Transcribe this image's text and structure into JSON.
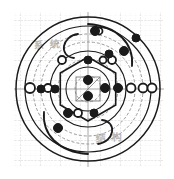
{
  "figure": {
    "kind": "technical-drawing",
    "background": "#ffffff",
    "ink": "#1a1a1a",
    "grid_minor_color": "#d9d9d9",
    "grid_major_color": "#bdbdbd",
    "axis_color": "#8a8a8a",
    "watermark_color": "#b8b8b8",
    "width": 174,
    "height": 179
  },
  "watermarks": [
    {
      "id": "top-left",
      "text": "系 统",
      "x": 34,
      "y": 36
    },
    {
      "id": "bottom-right",
      "text": "结 构",
      "x": 96,
      "y": 129
    }
  ],
  "grid": {
    "minor_spacing": 5,
    "major_spacing": 20,
    "origin_x": 88,
    "origin_y": 89,
    "style": "dotted"
  },
  "chart_data": {
    "type": "scatter",
    "title": "",
    "xlabel": "",
    "ylabel": "",
    "center": [
      88,
      89
    ],
    "rings": [
      {
        "name": "outer-boundary",
        "r": 72,
        "stroke": "#1a1a1a",
        "width": 1.5,
        "dash": "none"
      },
      {
        "name": "ring-2",
        "r": 63,
        "stroke": "#1a1a1a",
        "width": 1.2,
        "dash": "none"
      },
      {
        "name": "ring-3",
        "r": 55,
        "stroke": "#9a9a9a",
        "width": 1.0,
        "dash": "3 2"
      },
      {
        "name": "ring-4",
        "r": 47,
        "stroke": "#9a9a9a",
        "width": 1.0,
        "dash": "3 2"
      },
      {
        "name": "ring-5",
        "r": 38,
        "stroke": "#1a1a1a",
        "width": 1.2,
        "dash": "none"
      },
      {
        "name": "ring-6",
        "r": 30,
        "stroke": "#9a9a9a",
        "width": 1.0,
        "dash": "3 2"
      },
      {
        "name": "ring-7",
        "r": 22,
        "stroke": "#1a1a1a",
        "width": 1.1,
        "dash": "none"
      },
      {
        "name": "ring-8",
        "r": 13,
        "stroke": "#9a9a9a",
        "width": 1.0,
        "dash": "3 2"
      }
    ],
    "hexagon": {
      "name": "inner-hexagon",
      "r": 32,
      "rotation": 0,
      "stroke": "#1a1a1a",
      "width": 1.6
    },
    "center_square": {
      "x": 76,
      "y": 77,
      "w": 24,
      "h": 24,
      "stroke": "#7a7a7a"
    },
    "nodes_filled": [
      {
        "id": "n01",
        "x": 88,
        "y": 60,
        "r": 4
      },
      {
        "id": "n02",
        "x": 109,
        "y": 54,
        "r": 4
      },
      {
        "id": "n03",
        "x": 124,
        "y": 51,
        "r": 4.5
      },
      {
        "id": "n04",
        "x": 136,
        "y": 38,
        "r": 4
      },
      {
        "id": "n05",
        "x": 95,
        "y": 31,
        "r": 4.5
      },
      {
        "id": "n06",
        "x": 118,
        "y": 88,
        "r": 4.5
      },
      {
        "id": "n07",
        "x": 105,
        "y": 88,
        "r": 4.5
      },
      {
        "id": "n08",
        "x": 88,
        "y": 80,
        "r": 4.5
      },
      {
        "id": "n09",
        "x": 88,
        "y": 96,
        "r": 4.5
      },
      {
        "id": "n10",
        "x": 68,
        "y": 113,
        "r": 4.5
      },
      {
        "id": "n11",
        "x": 94,
        "y": 113,
        "r": 4
      },
      {
        "id": "n12",
        "x": 58,
        "y": 128,
        "r": 4.5
      },
      {
        "id": "n13",
        "x": 41,
        "y": 89,
        "r": 4
      },
      {
        "id": "n14",
        "x": 55,
        "y": 89,
        "r": 4
      }
    ],
    "nodes_open": [
      {
        "id": "o01",
        "x": 112,
        "y": 60,
        "r": 4
      },
      {
        "id": "o02",
        "x": 62,
        "y": 60,
        "r": 4
      },
      {
        "id": "o03",
        "x": 99,
        "y": 31,
        "r": 3.5
      },
      {
        "id": "o04",
        "x": 131,
        "y": 88,
        "r": 4.5
      },
      {
        "id": "o05",
        "x": 143,
        "y": 88,
        "r": 4.5
      },
      {
        "id": "o06",
        "x": 152,
        "y": 88,
        "r": 4.5
      },
      {
        "id": "o07",
        "x": 30,
        "y": 88,
        "r": 5
      },
      {
        "id": "o08",
        "x": 48,
        "y": 88,
        "r": 4
      },
      {
        "id": "o09",
        "x": 78,
        "y": 113,
        "r": 4
      },
      {
        "id": "o10",
        "x": 103,
        "y": 60,
        "r": 3.5
      }
    ],
    "arcs": [
      {
        "id": "a1",
        "d": "M 88 24 C 118 26 134 44 132 66"
      },
      {
        "id": "a2",
        "d": "M 88 154 C 58 152 42 134 44 112"
      },
      {
        "id": "a3",
        "d": "M 78 34 C 62 36 58 56 74 58"
      },
      {
        "id": "a4",
        "d": "M 98 144 C 114 142 118 122 102 120"
      }
    ],
    "legend": {
      "show": false,
      "entries": []
    },
    "grid_on": true
  }
}
